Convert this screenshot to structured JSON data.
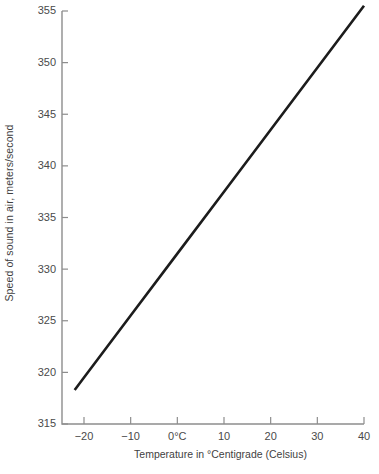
{
  "chart_data": {
    "type": "line",
    "title": "",
    "xlabel": "Temperature in °Centigrade (Celsius)",
    "ylabel": "Speed of sound in air, meters/second",
    "xlim": [
      -22,
      40
    ],
    "ylim": [
      315,
      355
    ],
    "xticks": [
      -20,
      -10,
      0,
      10,
      20,
      30,
      40
    ],
    "xticklabels": [
      "−20",
      "−10",
      "0°C",
      "10",
      "20",
      "30",
      "40"
    ],
    "yticks": [
      315,
      320,
      325,
      330,
      335,
      340,
      345,
      350,
      355
    ],
    "yticklabels": [
      "315",
      "320",
      "325",
      "330",
      "335",
      "340",
      "345",
      "350",
      "355"
    ],
    "grid": false,
    "legend": null,
    "relation": "v = 331.5 + 0.6 T",
    "series": [
      {
        "name": "Speed of sound in air",
        "color": "#1c1c1c",
        "x": [
          -22,
          -20,
          -10,
          0,
          10,
          20,
          30,
          40
        ],
        "values": [
          318.3,
          319.5,
          325.5,
          331.5,
          337.5,
          343.5,
          349.5,
          355.5
        ]
      }
    ]
  },
  "axes": {
    "spine_color": "#8d8d8d",
    "tick_color": "#8d8d8d",
    "text_color": "#4a4a4a"
  }
}
